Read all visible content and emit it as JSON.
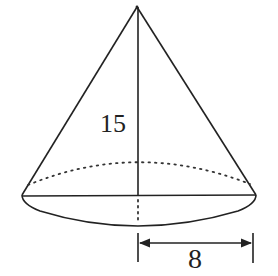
{
  "figure": {
    "type": "cone",
    "height_label": "15",
    "radius_label": "8",
    "stroke_color": "#222222",
    "background": "#ffffff"
  }
}
